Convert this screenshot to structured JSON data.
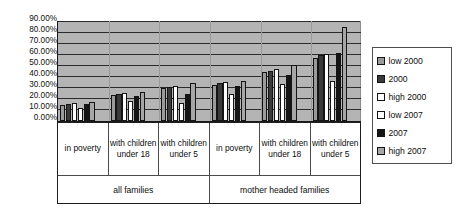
{
  "top_artifact": "",
  "legend": {
    "position": "right",
    "items": [
      {
        "label": "low 2000",
        "color": "#9a9a9a",
        "icon": "square-swatch-icon"
      },
      {
        "label": "2000",
        "color": "#3a3a3a",
        "icon": "square-swatch-icon"
      },
      {
        "label": "high 2000",
        "color": "#ffffff",
        "icon": "square-swatch-icon"
      },
      {
        "label": "low 2007",
        "color": "#ffffff",
        "icon": "square-swatch-icon"
      },
      {
        "label": "2007",
        "color": "#141414",
        "icon": "square-swatch-icon"
      },
      {
        "label": "high 2007",
        "color": "#a6a6a6",
        "icon": "square-swatch-icon"
      }
    ]
  },
  "axis": {
    "y_ticks": [
      "90.00%",
      "80.00%",
      "70.00%",
      "60.00%",
      "50.00%",
      "40.00%",
      "30.00%",
      "20.00%",
      "10.00%",
      "0.00%"
    ]
  },
  "categories_row": [
    "in poverty",
    "with children under 18",
    "with children under 5",
    "in poverty",
    "with children under 18",
    "with children under 5"
  ],
  "supercategories": [
    "all families",
    "mother headed families"
  ],
  "chart_data": {
    "type": "bar",
    "title": "",
    "subtitle": "",
    "xlabel": "",
    "ylabel": "",
    "ylim": [
      0,
      90
    ],
    "y_tick_step": 10,
    "y_tick_format": "percent-2dp",
    "grid": true,
    "legend_position": "right",
    "plot_background": "#b4b4b4",
    "categories": [
      "all families / in poverty",
      "all families / with children under 18",
      "all families / with children under 5",
      "mother headed families / in poverty",
      "mother headed families / with children under 18",
      "mother headed families / with children under 5"
    ],
    "series": [
      {
        "name": "low 2000",
        "color": "#9a9a9a",
        "values": [
          14.0,
          23.0,
          29.5,
          32.0,
          44.0,
          56.5
        ]
      },
      {
        "name": "2000",
        "color": "#3a3a3a",
        "values": [
          15.0,
          24.5,
          30.0,
          33.5,
          45.0,
          59.0
        ]
      },
      {
        "name": "high 2000",
        "color": "#ffffff",
        "values": [
          16.0,
          25.0,
          31.5,
          35.0,
          46.0,
          60.0
        ]
      },
      {
        "name": "low 2007",
        "color": "#ffffff",
        "values": [
          12.0,
          18.0,
          16.0,
          24.5,
          33.0,
          36.0
        ]
      },
      {
        "name": "2007",
        "color": "#141414",
        "values": [
          15.0,
          22.5,
          24.5,
          31.0,
          41.0,
          61.0
        ]
      },
      {
        "name": "high 2007",
        "color": "#a6a6a6",
        "values": [
          16.5,
          25.5,
          33.5,
          35.5,
          50.0,
          84.0
        ]
      }
    ]
  }
}
